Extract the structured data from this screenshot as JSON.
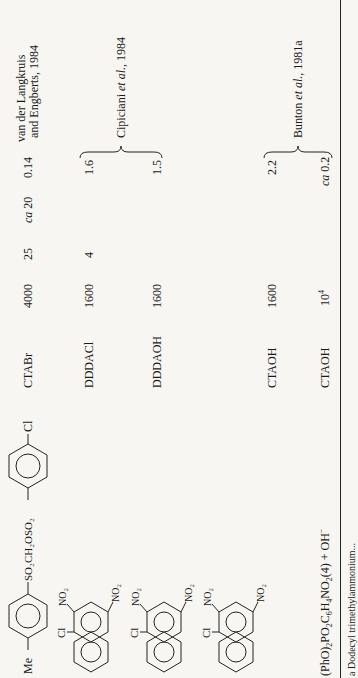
{
  "table": {
    "rows": [
      {
        "substrate": {
          "type": "structure",
          "name": "4-Me-C6H4-SO2CH2OSO2-C6H4-Cl(4)",
          "labels": {
            "left": "Me",
            "linker": "SO2CH2OSO2",
            "right": "Cl"
          }
        },
        "surfactant": "CTABr",
        "col_a": "4000",
        "col_b": "25",
        "col_c": "ca 20",
        "col_d": "0.14",
        "reference": [
          "van der Langkruis",
          "and Engberts, 1984"
        ]
      },
      {
        "substrate": {
          "type": "structure",
          "name": "1-chloro-2,4-dinitronaphthalene",
          "labels": {
            "cl": "Cl",
            "no2_top": "NO2",
            "no2_bottom": "NO2"
          }
        },
        "surfactant": "DDDACl",
        "col_a": "1600",
        "col_b": "4",
        "col_c": "",
        "col_d": "1.6",
        "reference": [
          "Cipiciani et al., 1984"
        ]
      },
      {
        "substrate": {
          "type": "structure",
          "name": "1-chloro-2,4-dinitronaphthalene",
          "labels": {
            "cl": "Cl",
            "no2_top": "NO2",
            "no2_bottom": "NO2"
          }
        },
        "surfactant": "DDDAOH",
        "col_a": "1600",
        "col_b": "",
        "col_c": "",
        "col_d": "1.5",
        "reference": []
      },
      {
        "substrate": {
          "type": "structure",
          "name": "1-chloro-2,4-dinitronaphthalene",
          "labels": {
            "cl": "Cl",
            "no2_top": "NO2",
            "no2_bottom": "NO2"
          }
        },
        "surfactant": "CTAOH",
        "col_a": "1600",
        "col_b": "",
        "col_c": "",
        "col_d": "2.2",
        "reference": [
          "Bunton et al., 1981a"
        ]
      },
      {
        "substrate": {
          "type": "text",
          "text": "(PhO)2PO2C6H4NO2(4) + OH−"
        },
        "surfactant": "CTAOH",
        "col_a": "10⁴",
        "col_b": "",
        "col_c": "",
        "col_d": "ca 0.2",
        "reference": []
      }
    ],
    "labels": {
      "r1_surf": "CTABr",
      "r1_a": "4000",
      "r1_b": "25",
      "r1_c_ital": "ca",
      "r1_c_num": " 20",
      "r1_d": "0.14",
      "r1_ref1": "van der Langkruis",
      "r1_ref2": "and Engberts, 1984",
      "r2_surf": "DDDACl",
      "r2_a": "1600",
      "r2_b": "4",
      "r2_d": "1.6",
      "ref2_pre": "Cipiciani ",
      "ref2_ital": "et al.",
      "ref2_post": ", 1984",
      "r3_surf": "DDDAOH",
      "r3_a": "1600",
      "r3_d": "1.5",
      "r4_surf": "CTAOH",
      "r4_a": "1600",
      "r4_d": "2.2",
      "ref4_pre": "Bunton ",
      "ref4_ital": "et al.",
      "ref4_post": ", 1981a",
      "r5_surf": "CTAOH",
      "r5_a_base": "10",
      "r5_a_exp": "4",
      "r5_d_ital": "ca",
      "r5_d_num": " 0.2",
      "me": "Me",
      "linker": "SO₂CH₂OSO₂",
      "cl": "Cl",
      "no2": "NO₂",
      "r5_pho": "(PhO)",
      "r5_s1": "2",
      "r5_po": "PO",
      "r5_s2": "2",
      "r5_c": "C",
      "r5_s3": "6",
      "r5_h": "H",
      "r5_s4": "4",
      "r5_no": "NO",
      "r5_s5": "2",
      "r5_tail": "(4) + OH",
      "r5_minus": "−"
    },
    "footnote": "a Dodecyl trimethylammonium..."
  }
}
